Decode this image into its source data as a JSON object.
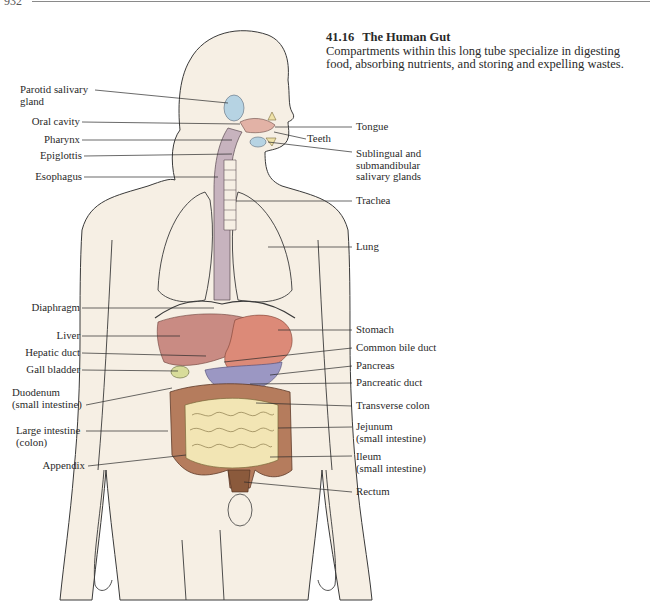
{
  "page": {
    "number": "932",
    "figure": {
      "number": "41.16",
      "title": "The Human Gut",
      "caption": "Compartments within this long tube specialize in digesting food, absorbing nutrients, and storing and expelling wastes."
    }
  },
  "colors": {
    "skin": "#f6efe4",
    "outline": "#3a3a3a",
    "esophagus": "#c7b3be",
    "salivary_gland": "#b6d3e3",
    "liver": "#c98b83",
    "stomach": "#dc8a78",
    "pancreas": "#9b97c3",
    "colon": "#b57c5d",
    "small_intestine": "#f2e5b4",
    "rectum": "#8b5a3c"
  },
  "labels": {
    "left": [
      {
        "id": "parotid",
        "line1": "Parotid salivary",
        "line2": "gland"
      },
      {
        "id": "oral_cavity",
        "line1": "Oral cavity"
      },
      {
        "id": "pharynx",
        "line1": "Pharynx"
      },
      {
        "id": "epiglottis",
        "line1": "Epiglottis"
      },
      {
        "id": "esophagus",
        "line1": "Esophagus"
      },
      {
        "id": "diaphragm",
        "line1": "Diaphragm"
      },
      {
        "id": "liver",
        "line1": "Liver"
      },
      {
        "id": "hepatic_duct",
        "line1": "Hepatic duct"
      },
      {
        "id": "gall_bladder",
        "line1": "Gall bladder"
      },
      {
        "id": "duodenum",
        "line1": "Duodenum",
        "line2": "(small intestine)"
      },
      {
        "id": "large_intestine",
        "line1": "Large intestine",
        "line2": "(colon)"
      },
      {
        "id": "appendix",
        "line1": "Appendix"
      }
    ],
    "right": [
      {
        "id": "tongue",
        "line1": "Tongue"
      },
      {
        "id": "teeth",
        "line1": "Teeth"
      },
      {
        "id": "sublingual",
        "line1": "Sublingual and",
        "line2": "submandibular",
        "line3": "salivary glands"
      },
      {
        "id": "trachea",
        "line1": "Trachea"
      },
      {
        "id": "lung",
        "line1": "Lung"
      },
      {
        "id": "stomach",
        "line1": "Stomach"
      },
      {
        "id": "common_bile_duct",
        "line1": "Common bile duct"
      },
      {
        "id": "pancreas",
        "line1": "Pancreas"
      },
      {
        "id": "pancreatic_duct",
        "line1": "Pancreatic duct"
      },
      {
        "id": "transverse_colon",
        "line1": "Transverse colon"
      },
      {
        "id": "jejunum",
        "line1": "Jejunum",
        "line2": "(small intestine)"
      },
      {
        "id": "ileum",
        "line1": "Ileum",
        "line2": "(small intestine)"
      },
      {
        "id": "rectum",
        "line1": "Rectum"
      }
    ]
  }
}
